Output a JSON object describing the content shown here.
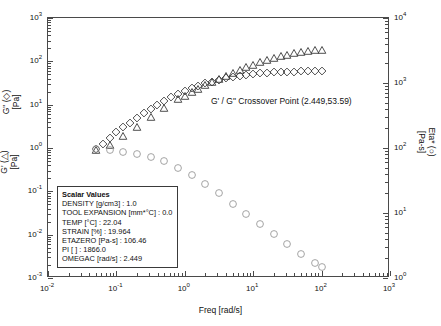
{
  "figure": {
    "background": "#ffffff",
    "frame_color": "#4a4a4a",
    "marker_color": "#3b3b3b",
    "eta_marker_color": "#9a9a9a"
  },
  "annotation": {
    "crossover_text": "G' / G\" Crossover Point (2.449,53.59)"
  },
  "scalar_panel": {
    "title": "Scalar Values",
    "rows": [
      "DENSITY [g/cm3] : 1.0",
      "TOOL EXPANSION [mm*°C] : 0.0",
      "TEMP [°C] : 22.04",
      "STRAIN [%] : 19.964",
      "ETAZERO [Pa-s] : 106.46",
      "PI [ ] : 1866.0",
      "OMEGAC [rad/s] : 2.449"
    ]
  },
  "axes": {
    "x": {
      "title": "Freq [rad/s]",
      "ticks": [
        "-2",
        "-1",
        "0",
        "1",
        "2",
        "3"
      ],
      "min_exp": -2,
      "max_exp": 3
    },
    "y_left": {
      "title_top": "G\" (◇)",
      "title_top_unit": "[Pa]",
      "title_bottom": "G' (△)",
      "title_bottom_unit": "[Pa]",
      "ticks": [
        "-3",
        "-2",
        "-1",
        "0",
        "1",
        "2",
        "3"
      ],
      "min_exp": -3,
      "max_exp": 3
    },
    "y_right": {
      "title": "Eta* (○)",
      "title_unit": "[Pa-s]",
      "ticks": [
        "0",
        "1",
        "2",
        "3",
        "4"
      ],
      "min_exp": 0,
      "max_exp": 4
    }
  },
  "chart_data": {
    "type": "scatter",
    "title": "",
    "xlabel": "Freq [rad/s]",
    "ylabel": "G' (△) [Pa] / G\" (◇) [Pa]",
    "y2label": "Eta* (○) [Pa-s]",
    "xscale": "log",
    "yscale": "log",
    "xlim": [
      0.01,
      1000
    ],
    "ylim": [
      0.001,
      1000
    ],
    "y2lim": [
      1,
      10000
    ],
    "grid": false,
    "legend": "none",
    "annotations": [
      {
        "text": "G' / G\" Crossover Point (2.449,53.59)",
        "x": 2.449,
        "y": 53.59
      }
    ],
    "series": [
      {
        "name": "G\" (loss modulus)",
        "marker": "diamond",
        "axis": "left",
        "unit": "Pa",
        "x": [
          0.05,
          0.0631,
          0.0794,
          0.1,
          0.1259,
          0.1585,
          0.1995,
          0.2512,
          0.3162,
          0.3981,
          0.5012,
          0.631,
          0.7943,
          1.0,
          1.2589,
          1.5849,
          1.9953,
          2.5119,
          3.1623,
          3.9811,
          5.0119,
          6.3096,
          7.9433,
          10.0,
          12.589,
          15.849,
          19.953,
          25.119,
          31.623,
          39.811,
          50.119,
          63.096,
          79.433,
          100.0
        ],
        "y": [
          0.95,
          1.25,
          1.7,
          2.3,
          3.0,
          3.85,
          5.0,
          6.4,
          8.1,
          10.0,
          12.3,
          14.8,
          17.6,
          20.8,
          24.0,
          27.4,
          30.8,
          34.0,
          37.3,
          40.5,
          43.5,
          46.2,
          48.6,
          50.8,
          52.6,
          54.2,
          55.5,
          56.6,
          57.4,
          58.0,
          58.4,
          58.7,
          58.9,
          59.0
        ]
      },
      {
        "name": "G' (storage modulus)",
        "marker": "triangle",
        "axis": "left",
        "unit": "Pa",
        "x": [
          0.05,
          0.0794,
          0.1259,
          0.1995,
          0.3162,
          0.5012,
          0.7943,
          1.0,
          1.2589,
          1.5849,
          1.9953,
          2.5119,
          3.1623,
          3.9811,
          5.0119,
          6.3096,
          7.9433,
          10.0,
          12.589,
          15.849,
          19.953,
          25.119,
          31.623,
          39.811,
          50.119,
          63.096,
          79.433,
          100.0
        ],
        "y": [
          0.9,
          1.2,
          1.9,
          3.1,
          5.2,
          8.4,
          13.2,
          16.0,
          19.5,
          23.5,
          28.0,
          33.0,
          40.0,
          47.0,
          55.0,
          64.0,
          74.0,
          84.0,
          95.0,
          106.0,
          118.0,
          130.0,
          142.0,
          152.0,
          163.0,
          172.0,
          180.0,
          187.0
        ]
      },
      {
        "name": "Eta* (complex viscosity)",
        "marker": "circle",
        "axis": "right",
        "unit": "Pa-s",
        "x": [
          0.05,
          0.0794,
          0.1259,
          0.1995,
          0.3162,
          0.5012,
          0.7943,
          1.2589,
          1.9953,
          3.1623,
          5.0119,
          7.9433,
          12.589,
          19.953,
          31.623,
          50.119,
          79.433,
          100.0
        ],
        "y": [
          95.0,
          92.0,
          88.0,
          82.0,
          73.0,
          62.0,
          50.0,
          38.0,
          28.0,
          20.0,
          14.0,
          9.8,
          6.8,
          4.7,
          3.3,
          2.3,
          1.7,
          1.5
        ]
      }
    ]
  }
}
